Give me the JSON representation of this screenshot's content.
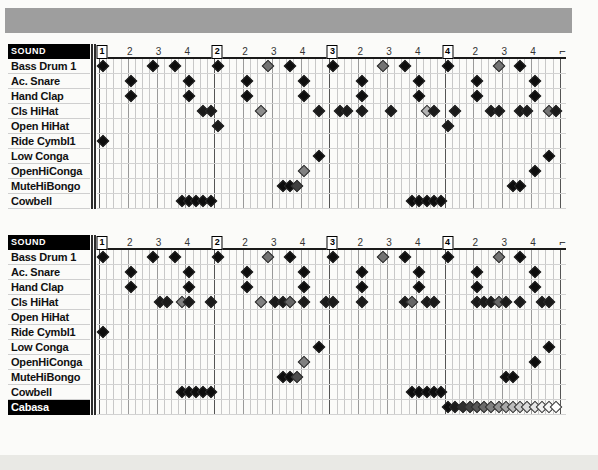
{
  "banner": {
    "name": "top-gray-banner"
  },
  "grid": {
    "steps_per_bar": 16,
    "bars": 4,
    "step_width_px": 7.2,
    "beat_labels": [
      "1",
      "2",
      "3",
      "4"
    ],
    "sub_beat_labels": [
      "2",
      "3",
      "4"
    ],
    "end_marker": "⌐"
  },
  "patterns": [
    {
      "name": "pattern-1",
      "header_label": "SOUND",
      "selected_row": null,
      "rows": [
        {
          "label": "Bass Drum 1",
          "notes": [
            {
              "step": 0,
              "v": 0.95
            },
            {
              "step": 7,
              "v": 0.95
            },
            {
              "step": 10,
              "v": 0.95
            },
            {
              "step": 16,
              "v": 0.95
            },
            {
              "step": 23,
              "v": 0.55
            },
            {
              "step": 26,
              "v": 0.95
            },
            {
              "step": 32,
              "v": 0.95
            },
            {
              "step": 39,
              "v": 0.55
            },
            {
              "step": 42,
              "v": 0.95
            },
            {
              "step": 48,
              "v": 0.95
            },
            {
              "step": 55,
              "v": 0.55
            },
            {
              "step": 58,
              "v": 0.95
            }
          ]
        },
        {
          "label": "Ac. Snare",
          "notes": [
            {
              "step": 4,
              "v": 0.95
            },
            {
              "step": 12,
              "v": 0.95
            },
            {
              "step": 20,
              "v": 0.95
            },
            {
              "step": 28,
              "v": 0.95
            },
            {
              "step": 36,
              "v": 0.95
            },
            {
              "step": 44,
              "v": 0.95
            },
            {
              "step": 52,
              "v": 0.95
            },
            {
              "step": 60,
              "v": 0.95
            }
          ]
        },
        {
          "label": "Hand Clap",
          "notes": [
            {
              "step": 4,
              "v": 0.95
            },
            {
              "step": 12,
              "v": 0.95
            },
            {
              "step": 20,
              "v": 0.95
            },
            {
              "step": 28,
              "v": 0.95
            },
            {
              "step": 36,
              "v": 0.95
            },
            {
              "step": 44,
              "v": 0.95
            },
            {
              "step": 52,
              "v": 0.95
            },
            {
              "step": 60,
              "v": 0.95
            }
          ]
        },
        {
          "label": "Cls HiHat",
          "notes": [
            {
              "step": 14,
              "v": 0.9
            },
            {
              "step": 15,
              "v": 0.9
            },
            {
              "step": 22,
              "v": 0.45
            },
            {
              "step": 30,
              "v": 0.9
            },
            {
              "step": 33,
              "v": 0.9
            },
            {
              "step": 34,
              "v": 0.9
            },
            {
              "step": 36,
              "v": 0.9
            },
            {
              "step": 40,
              "v": 0.9
            },
            {
              "step": 45,
              "v": 0.3
            },
            {
              "step": 46,
              "v": 0.9
            },
            {
              "step": 49,
              "v": 0.9
            },
            {
              "step": 54,
              "v": 0.9
            },
            {
              "step": 55,
              "v": 0.9
            },
            {
              "step": 58,
              "v": 0.9
            },
            {
              "step": 59,
              "v": 0.9
            },
            {
              "step": 62,
              "v": 0.55
            },
            {
              "step": 63,
              "v": 0.9
            }
          ]
        },
        {
          "label": "Open HiHat",
          "notes": [
            {
              "step": 16,
              "v": 0.9
            },
            {
              "step": 48,
              "v": 0.9
            }
          ]
        },
        {
          "label": "Ride Cymbl1",
          "notes": [
            {
              "step": 0,
              "v": 0.95
            }
          ]
        },
        {
          "label": "Low Conga",
          "notes": [
            {
              "step": 30,
              "v": 0.95
            },
            {
              "step": 62,
              "v": 0.95
            }
          ]
        },
        {
          "label": "OpenHiConga",
          "notes": [
            {
              "step": 28,
              "v": 0.5
            },
            {
              "step": 60,
              "v": 0.95
            }
          ]
        },
        {
          "label": "MuteHiBongo",
          "notes": [
            {
              "step": 25,
              "v": 0.95
            },
            {
              "step": 26,
              "v": 0.95
            },
            {
              "step": 27,
              "v": 0.75
            },
            {
              "step": 57,
              "v": 0.95
            },
            {
              "step": 58,
              "v": 0.95
            }
          ]
        },
        {
          "label": "Cowbell",
          "notes": [
            {
              "step": 11,
              "v": 0.95
            },
            {
              "step": 12,
              "v": 0.95
            },
            {
              "step": 13,
              "v": 0.95
            },
            {
              "step": 14,
              "v": 0.95
            },
            {
              "step": 15,
              "v": 0.95
            },
            {
              "step": 43,
              "v": 0.95
            },
            {
              "step": 44,
              "v": 0.95
            },
            {
              "step": 45,
              "v": 0.95
            },
            {
              "step": 46,
              "v": 0.95
            },
            {
              "step": 47,
              "v": 0.95
            }
          ]
        }
      ]
    },
    {
      "name": "pattern-2",
      "header_label": "SOUND",
      "selected_row": "Cabasa",
      "rows": [
        {
          "label": "Bass Drum 1",
          "notes": [
            {
              "step": 0,
              "v": 0.95
            },
            {
              "step": 7,
              "v": 0.95
            },
            {
              "step": 10,
              "v": 0.95
            },
            {
              "step": 16,
              "v": 0.95
            },
            {
              "step": 23,
              "v": 0.55
            },
            {
              "step": 26,
              "v": 0.95
            },
            {
              "step": 32,
              "v": 0.95
            },
            {
              "step": 39,
              "v": 0.55
            },
            {
              "step": 42,
              "v": 0.95
            },
            {
              "step": 48,
              "v": 0.95
            },
            {
              "step": 55,
              "v": 0.55
            },
            {
              "step": 58,
              "v": 0.95
            }
          ]
        },
        {
          "label": "Ac. Snare",
          "notes": [
            {
              "step": 4,
              "v": 0.95
            },
            {
              "step": 12,
              "v": 0.95
            },
            {
              "step": 20,
              "v": 0.95
            },
            {
              "step": 28,
              "v": 0.95
            },
            {
              "step": 36,
              "v": 0.95
            },
            {
              "step": 44,
              "v": 0.95
            },
            {
              "step": 52,
              "v": 0.95
            },
            {
              "step": 60,
              "v": 0.95
            }
          ]
        },
        {
          "label": "Hand Clap",
          "notes": [
            {
              "step": 4,
              "v": 0.95
            },
            {
              "step": 12,
              "v": 0.95
            },
            {
              "step": 20,
              "v": 0.95
            },
            {
              "step": 28,
              "v": 0.95
            },
            {
              "step": 36,
              "v": 0.95
            },
            {
              "step": 44,
              "v": 0.95
            },
            {
              "step": 52,
              "v": 0.95
            },
            {
              "step": 60,
              "v": 0.95
            }
          ]
        },
        {
          "label": "Cls HiHat",
          "notes": [
            {
              "step": 8,
              "v": 0.9
            },
            {
              "step": 9,
              "v": 0.9
            },
            {
              "step": 11,
              "v": 0.5
            },
            {
              "step": 12,
              "v": 0.9
            },
            {
              "step": 15,
              "v": 0.9
            },
            {
              "step": 22,
              "v": 0.5
            },
            {
              "step": 24,
              "v": 0.9
            },
            {
              "step": 25,
              "v": 0.9
            },
            {
              "step": 26,
              "v": 0.6
            },
            {
              "step": 28,
              "v": 0.9
            },
            {
              "step": 31,
              "v": 0.9
            },
            {
              "step": 32,
              "v": 0.9
            },
            {
              "step": 36,
              "v": 0.9
            },
            {
              "step": 42,
              "v": 0.9
            },
            {
              "step": 43,
              "v": 0.6
            },
            {
              "step": 45,
              "v": 0.9
            },
            {
              "step": 46,
              "v": 0.9
            },
            {
              "step": 52,
              "v": 0.9
            },
            {
              "step": 53,
              "v": 0.9
            },
            {
              "step": 54,
              "v": 0.9
            },
            {
              "step": 55,
              "v": 0.6
            },
            {
              "step": 56,
              "v": 0.9
            },
            {
              "step": 58,
              "v": 0.9
            },
            {
              "step": 61,
              "v": 0.9
            },
            {
              "step": 62,
              "v": 0.9
            }
          ]
        },
        {
          "label": "Open HiHat",
          "notes": []
        },
        {
          "label": "Ride Cymbl1",
          "notes": [
            {
              "step": 0,
              "v": 0.95
            }
          ]
        },
        {
          "label": "Low Conga",
          "notes": [
            {
              "step": 30,
              "v": 0.95
            },
            {
              "step": 62,
              "v": 0.95
            }
          ]
        },
        {
          "label": "OpenHiConga",
          "notes": [
            {
              "step": 28,
              "v": 0.5
            },
            {
              "step": 60,
              "v": 0.95
            }
          ]
        },
        {
          "label": "MuteHiBongo",
          "notes": [
            {
              "step": 25,
              "v": 0.95
            },
            {
              "step": 26,
              "v": 0.95
            },
            {
              "step": 27,
              "v": 0.7
            },
            {
              "step": 56,
              "v": 0.95
            },
            {
              "step": 57,
              "v": 0.95
            }
          ]
        },
        {
          "label": "Cowbell",
          "notes": [
            {
              "step": 11,
              "v": 0.95
            },
            {
              "step": 12,
              "v": 0.95
            },
            {
              "step": 13,
              "v": 0.95
            },
            {
              "step": 14,
              "v": 0.95
            },
            {
              "step": 15,
              "v": 0.95
            },
            {
              "step": 43,
              "v": 0.95
            },
            {
              "step": 44,
              "v": 0.95
            },
            {
              "step": 45,
              "v": 0.95
            },
            {
              "step": 46,
              "v": 0.95
            },
            {
              "step": 47,
              "v": 0.95
            }
          ]
        },
        {
          "label": "Cabasa",
          "notes": [
            {
              "step": 48,
              "v": 0.95
            },
            {
              "step": 49,
              "v": 0.9
            },
            {
              "step": 50,
              "v": 0.82
            },
            {
              "step": 51,
              "v": 0.74
            },
            {
              "step": 52,
              "v": 0.66
            },
            {
              "step": 53,
              "v": 0.58
            },
            {
              "step": 54,
              "v": 0.5
            },
            {
              "step": 55,
              "v": 0.42
            },
            {
              "step": 56,
              "v": 0.34
            },
            {
              "step": 57,
              "v": 0.26
            },
            {
              "step": 58,
              "v": 0.2
            },
            {
              "step": 59,
              "v": 0.14
            },
            {
              "step": 60,
              "v": 0.1
            },
            {
              "step": 61,
              "v": 0.06
            },
            {
              "step": 62,
              "v": 0.03
            },
            {
              "step": 63,
              "v": 0.0
            }
          ]
        }
      ]
    }
  ],
  "colors": {
    "banner": "#9e9e9e",
    "note_outline": "#2a2a2a",
    "header_bg": "#000000",
    "header_fg": "#ffffff",
    "grid_line": "#c8c8c8",
    "beat_line": "#9a9a9a",
    "bar_line": "#555555",
    "page_bg": "#fbfbf9"
  }
}
